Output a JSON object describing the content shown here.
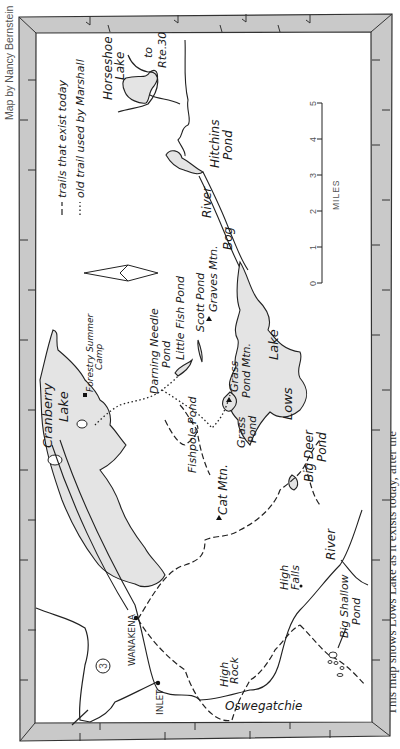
{
  "credit": "Map by Nancy Bernstein",
  "caption": "This map shows Lows Lake as it exists today, after the",
  "legend": {
    "trail_today": "trails that exist today",
    "old_trail": "old trail used by Marshall"
  },
  "scale": {
    "title": "MILES",
    "ticks": [
      "0",
      "1",
      "2",
      "3",
      "4",
      "5"
    ]
  },
  "north_arrow": "north-arrow",
  "labels": {
    "horseshoe_lake": [
      "Horseshoe",
      "Lake"
    ],
    "to_rte30": [
      "to",
      "Rte.30"
    ],
    "hitchins_pond": [
      "Hitchins",
      "Pond"
    ],
    "bog_river": "Bog",
    "river1": "River",
    "cranberry_lake": [
      "Cranberry",
      "Lake"
    ],
    "forestry_camp": [
      "Forestry Summer",
      "Camp"
    ],
    "darning_needle": [
      "Darning Needle",
      "Pond"
    ],
    "little_fish": "Little Fish Pond",
    "scott_pond": "Scott Pond",
    "graves_mtn": "Graves Mtn.",
    "grass_pond_mtn": [
      "Grass",
      "Pond Mtn."
    ],
    "fishpole_pond": "Fishpole Pond",
    "grass_pond": [
      "Grass",
      "Pond"
    ],
    "lows_lake": [
      "Lows",
      "Lake"
    ],
    "big_deer_pond": [
      "Big Deer",
      "Pond"
    ],
    "cat_mtn": "Cat Mtn.",
    "wanakena": "WANAKENA",
    "inlet": "INLET",
    "route3": "3",
    "high_rock": [
      "High",
      "Rock"
    ],
    "high_falls": [
      "High",
      "Falls"
    ],
    "river2": "River",
    "big_shallow": [
      "Big Shallow",
      "Pond"
    ],
    "oswegatchie": "Oswegatchie"
  },
  "colors": {
    "frame": "#c9c9c9",
    "water": "#e4e4e4",
    "ink": "#1a1a1a"
  }
}
